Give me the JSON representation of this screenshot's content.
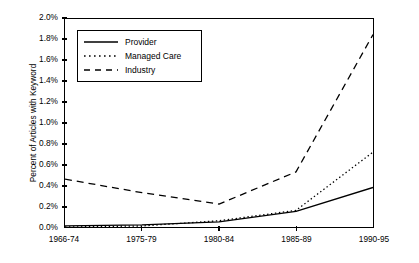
{
  "chart_data": {
    "type": "line",
    "title": "",
    "xlabel": "",
    "ylabel": "Percent of Articles with Keyword",
    "categories": [
      "1966-74",
      "1975-79",
      "1980-84",
      "1985-89",
      "1990-95"
    ],
    "ylim": [
      0.0,
      2.0
    ],
    "ytick_values": [
      0.0,
      0.2,
      0.4,
      0.6,
      0.8,
      1.0,
      1.2,
      1.4,
      1.6,
      1.8,
      2.0
    ],
    "ytick_labels": [
      "0.0%",
      "0.2%",
      "0.4%",
      "0.6%",
      "0.8%",
      "1.0%",
      "1.2%",
      "1.4%",
      "1.6%",
      "1.8%",
      "2.0%"
    ],
    "grid": false,
    "legend_position": "upper-left-inside",
    "series": [
      {
        "name": "Provider",
        "style": "solid",
        "color": "#000000",
        "values": [
          0.01,
          0.02,
          0.05,
          0.15,
          0.38
        ]
      },
      {
        "name": "Managed Care",
        "style": "dotted",
        "color": "#000000",
        "values": [
          0.0,
          0.01,
          0.06,
          0.16,
          0.72
        ]
      },
      {
        "name": "Industry",
        "style": "dashed",
        "color": "#000000",
        "values": [
          0.46,
          0.33,
          0.22,
          0.53,
          1.85
        ]
      }
    ]
  },
  "legend": {
    "items": [
      {
        "label": "Provider",
        "style": "solid"
      },
      {
        "label": "Managed Care",
        "style": "dotted"
      },
      {
        "label": "Industry",
        "style": "dashed"
      }
    ]
  }
}
